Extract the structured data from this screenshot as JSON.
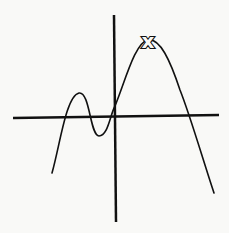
{
  "diagram": {
    "type": "function-graph",
    "colors": {
      "background": "#f9f9f7",
      "ink": "#111111"
    },
    "axes": {
      "x_axis": {
        "x1": 13,
        "y1": 118,
        "x2": 219,
        "y2": 115
      },
      "y_axis": {
        "x1": 114,
        "y1": 15,
        "x2": 116,
        "y2": 222
      }
    },
    "curve": {
      "path": "M52,173 C60,145 66,96 79,93 C90,91 90,136 99,136 C108,136 110,115 115,106 C125,82 135,42 148,40 C160,38 170,60 180,90 C190,115 203,160 214,193",
      "features": [
        {
          "name": "local-max",
          "x": 79,
          "y": 93
        },
        {
          "name": "local-min",
          "x": 99,
          "y": 136
        },
        {
          "name": "global-max",
          "x": 148,
          "y": 40
        }
      ]
    },
    "marker": {
      "label": "x",
      "x": 148,
      "y": 41
    }
  }
}
